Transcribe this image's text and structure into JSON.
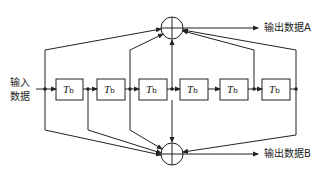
{
  "diagram": {
    "type": "convolutional-encoder",
    "input_label_line1": "输入",
    "input_label_line2": "数据",
    "output_a_label": "输出数据A",
    "output_b_label": "输出数据B",
    "delay_element_symbol": "T",
    "delay_element_subscript": "b",
    "delay_elements": [
      {
        "id": 1,
        "label": "Tb"
      },
      {
        "id": 2,
        "label": "Tb"
      },
      {
        "id": 3,
        "label": "Tb"
      },
      {
        "id": 4,
        "label": "Tb"
      },
      {
        "id": 5,
        "label": "Tb"
      },
      {
        "id": 6,
        "label": "Tb"
      }
    ],
    "adders": [
      {
        "id": "top",
        "symbol": "⊕",
        "output": "输出数据A",
        "taps_after_stage": [
          0,
          2,
          3,
          5,
          6
        ]
      },
      {
        "id": "bottom",
        "symbol": "⊕",
        "output": "输出数据B",
        "taps_after_stage": [
          0,
          1,
          2,
          3,
          6
        ]
      }
    ],
    "line_color": "#222222"
  }
}
